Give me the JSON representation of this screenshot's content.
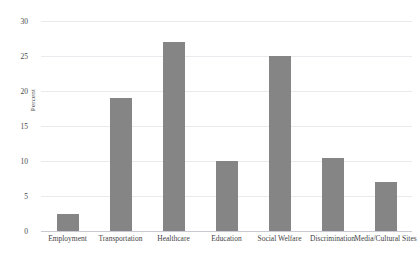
{
  "chart_data": {
    "type": "bar",
    "title": "",
    "xlabel": "",
    "ylabel": "Percent",
    "categories": [
      "Employment",
      "Transportation",
      "Healthcare",
      "Education",
      "Social Welfare",
      "Discrimination",
      "Media/Cultural Sites"
    ],
    "values": [
      2.5,
      19,
      27,
      10,
      25,
      10.5,
      7
    ],
    "ylim": [
      0,
      30
    ],
    "yticks": [
      0,
      5,
      10,
      15,
      20,
      25,
      30
    ],
    "ytick_labels": [
      "0",
      "5",
      "10",
      "15",
      "20",
      "25",
      "30"
    ],
    "grid": true,
    "legend": false,
    "bar_color": "#858585",
    "grid_color": "#e9e9ee",
    "axis_color": "#c9c9cf"
  }
}
